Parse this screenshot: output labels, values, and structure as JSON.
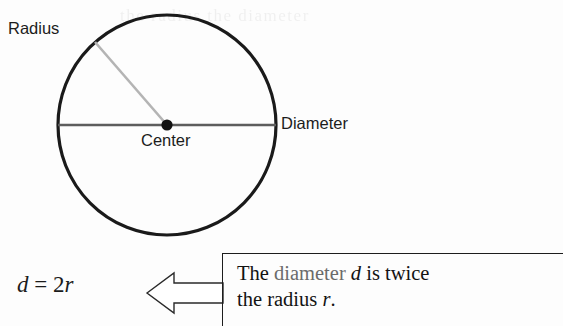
{
  "figure": {
    "type": "geometry-diagram",
    "ghost_text": "the radius the diameter"
  },
  "diagram": {
    "labels": {
      "radius": "Radius",
      "diameter": "Diameter",
      "center": "Center"
    },
    "geometry": {
      "circle_center_x": 167,
      "circle_center_y": 125,
      "circle_radius_x": 110,
      "circle_radius_y": 111,
      "radius_endpoint_x": 95,
      "radius_endpoint_y": 42,
      "diameter_start_x": 57,
      "diameter_end_x": 277,
      "diameter_y": 125,
      "center_dot_radius": 5.5
    },
    "colors": {
      "circle_stroke": "#1a1a1a",
      "diameter_line": "#5d5d5d",
      "radius_line": "#b4b4b4",
      "center_dot": "#111111",
      "label_text": "#1c1c1c"
    }
  },
  "formula": {
    "lhs": "d",
    "operator": "=",
    "coefficient": "2",
    "rhs": "r",
    "full": "d = 2r"
  },
  "arrow": {
    "direction": "left",
    "style": "hollow-outline",
    "stroke_color": "#2a2a2a",
    "fill_color": "#ffffff"
  },
  "callout": {
    "line1_prefix": "The ",
    "line1_highlight": "diameter",
    "line1_var": "d",
    "line1_suffix": " is twice",
    "line2_prefix": "the radius ",
    "line2_var": "r",
    "line2_suffix": ".",
    "highlight_color": "#6b6b6b",
    "border_color": "#1d1d1d"
  }
}
